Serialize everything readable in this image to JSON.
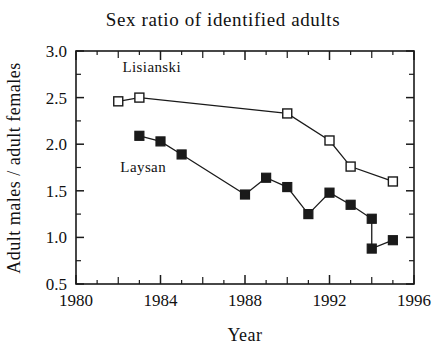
{
  "chart_data": {
    "type": "line",
    "title": "Sex ratio of identified adults",
    "xlabel": "Year",
    "ylabel": "Adult males / adult females",
    "xlim": [
      1980,
      1996
    ],
    "ylim": [
      0.5,
      3.0
    ],
    "xticks": [
      1980,
      1984,
      1988,
      1992,
      1996
    ],
    "xtick_labels": [
      "1980",
      "1984",
      "1988",
      "1992",
      "1996"
    ],
    "yticks": [
      0.5,
      1.0,
      1.5,
      2.0,
      2.5,
      3.0
    ],
    "ytick_labels": [
      "0.5",
      "1.0",
      "1.5",
      "2.0",
      "2.5",
      "3.0"
    ],
    "x_minor_step": 1,
    "y_minor_step": 0.25,
    "grid": false,
    "legend_position": "inline-annotations",
    "series": [
      {
        "name": "Lisianski",
        "marker": "open-square",
        "x": [
          1982,
          1983,
          1990,
          1992,
          1993,
          1995
        ],
        "values": [
          2.46,
          2.5,
          2.33,
          2.04,
          1.76,
          1.6
        ]
      },
      {
        "name": "Laysan",
        "marker": "filled-square",
        "x": [
          1983,
          1984,
          1985,
          1988,
          1989,
          1990,
          1991,
          1992,
          1993,
          1994,
          1994,
          1995
        ],
        "values": [
          2.09,
          2.03,
          1.89,
          1.46,
          1.64,
          1.54,
          1.25,
          1.48,
          1.35,
          1.2,
          0.88,
          0.97
        ]
      }
    ],
    "annotations": [
      {
        "text": "Lisianski",
        "x": 1982.2,
        "y": 2.78
      },
      {
        "text": "Laysan",
        "x": 1982.1,
        "y": 1.7
      }
    ]
  }
}
